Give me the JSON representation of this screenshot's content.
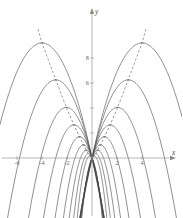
{
  "figure": {
    "title": "",
    "background_color": "#ffffff",
    "curve_color": "#4a4a4a",
    "axis_color": "#9a9a9a",
    "locus_color": "#7a7a7a",
    "label_color": "#6b6b6b"
  },
  "axes": {
    "x_axis_label": "x",
    "y_axis_label": "y",
    "origin_px": {
      "x": 92,
      "y": 158
    },
    "units_per_px": {
      "x": 12.5,
      "y": 12.5
    },
    "x_range": [
      -6.9,
      6.6
    ],
    "y_range": [
      -4.4,
      11.4
    ],
    "x_ticks": [
      {
        "value": -6,
        "label": "-6",
        "px": 17
      },
      {
        "value": -4,
        "label": "-4",
        "px": 42
      },
      {
        "value": -2,
        "label": "-2",
        "px": 67
      },
      {
        "value": 2,
        "label": "2",
        "px": 117
      },
      {
        "value": 4,
        "label": "4",
        "px": 142
      }
    ],
    "y_ticks": [
      {
        "value": 2,
        "label": "2",
        "px": 133
      },
      {
        "value": 4,
        "label": "4",
        "px": 108
      },
      {
        "value": 6,
        "label": "6",
        "px": 83
      },
      {
        "value": 8,
        "label": "8",
        "px": 58
      }
    ],
    "y_ticks_visible_labels": [
      "6",
      "8"
    ],
    "grid": false,
    "legend": false
  },
  "chart_data": {
    "type": "line",
    "title": "",
    "xlabel": "x",
    "ylabel": "y",
    "xlim": [
      -6.9,
      6.6
    ],
    "ylim": [
      -4.4,
      11.4
    ],
    "grid": false,
    "legend_position": "none",
    "series": [
      {
        "name": "parabola-left-1",
        "side": "left",
        "vertex": {
          "x": -4.0,
          "y": 9.2
        },
        "x_intercepts": [
          0.0,
          -8.0
        ],
        "style": "solid"
      },
      {
        "name": "parabola-left-2",
        "side": "left",
        "vertex": {
          "x": -2.9,
          "y": 6.25
        },
        "x_intercepts": [
          0.0,
          -5.8
        ],
        "style": "solid"
      },
      {
        "name": "parabola-left-3",
        "side": "left",
        "vertex": {
          "x": -2.05,
          "y": 4.05
        },
        "x_intercepts": [
          0.0,
          -4.1
        ],
        "style": "solid"
      },
      {
        "name": "parabola-left-4",
        "side": "left",
        "vertex": {
          "x": -1.45,
          "y": 2.65
        },
        "x_intercepts": [
          0.0,
          -2.9
        ],
        "style": "solid"
      },
      {
        "name": "parabola-left-5",
        "side": "left",
        "vertex": {
          "x": -1.0,
          "y": 1.7
        },
        "x_intercepts": [
          0.0,
          -2.0
        ],
        "style": "solid"
      },
      {
        "name": "parabola-left-6",
        "side": "left",
        "vertex": {
          "x": -0.68,
          "y": 1.05
        },
        "x_intercepts": [
          0.0,
          -1.36
        ],
        "style": "solid"
      },
      {
        "name": "parabola-left-7",
        "side": "left",
        "vertex": {
          "x": -0.46,
          "y": 0.62
        },
        "x_intercepts": [
          0.0,
          -0.92
        ],
        "style": "solid"
      },
      {
        "name": "parabola-left-8",
        "side": "left",
        "vertex": {
          "x": -0.3,
          "y": 0.34
        },
        "x_intercepts": [
          0.0,
          -0.6
        ],
        "style": "solid"
      },
      {
        "name": "parabola-left-9",
        "side": "left",
        "vertex": {
          "x": -0.18,
          "y": 0.16
        },
        "x_intercepts": [
          0.0,
          -0.36
        ],
        "style": "solid"
      },
      {
        "name": "parabola-right-1",
        "side": "right",
        "vertex": {
          "x": 4.0,
          "y": 9.2
        },
        "x_intercepts": [
          0.0,
          8.0
        ],
        "style": "solid"
      },
      {
        "name": "parabola-right-2",
        "side": "right",
        "vertex": {
          "x": 2.9,
          "y": 6.25
        },
        "x_intercepts": [
          0.0,
          5.8
        ],
        "style": "solid"
      },
      {
        "name": "parabola-right-3",
        "side": "right",
        "vertex": {
          "x": 2.05,
          "y": 4.05
        },
        "x_intercepts": [
          0.0,
          4.1
        ],
        "style": "solid"
      },
      {
        "name": "parabola-right-4",
        "side": "right",
        "vertex": {
          "x": 1.45,
          "y": 2.65
        },
        "x_intercepts": [
          0.0,
          2.9
        ],
        "style": "solid"
      },
      {
        "name": "parabola-right-5",
        "side": "right",
        "vertex": {
          "x": 1.0,
          "y": 1.7
        },
        "x_intercepts": [
          0.0,
          2.0
        ],
        "style": "solid"
      },
      {
        "name": "parabola-right-6",
        "side": "right",
        "vertex": {
          "x": 0.68,
          "y": 1.05
        },
        "x_intercepts": [
          0.0,
          1.36
        ],
        "style": "solid"
      },
      {
        "name": "parabola-right-7",
        "side": "right",
        "vertex": {
          "x": 0.46,
          "y": 0.62
        },
        "x_intercepts": [
          0.0,
          0.92
        ],
        "style": "solid"
      },
      {
        "name": "parabola-right-8",
        "side": "right",
        "vertex": {
          "x": 0.3,
          "y": 0.34
        },
        "x_intercepts": [
          0.0,
          0.6
        ],
        "style": "solid"
      },
      {
        "name": "parabola-right-9",
        "side": "right",
        "vertex": {
          "x": 0.18,
          "y": 0.16
        },
        "x_intercepts": [
          0.0,
          0.36
        ],
        "style": "solid"
      }
    ],
    "loci": [
      {
        "name": "vertex-locus-left",
        "style": "dashed",
        "points": [
          {
            "x": -0.1,
            "y": 0.06
          },
          {
            "x": -0.3,
            "y": 0.34
          },
          {
            "x": -0.68,
            "y": 1.05
          },
          {
            "x": -1.0,
            "y": 1.7
          },
          {
            "x": -1.45,
            "y": 2.65
          },
          {
            "x": -2.05,
            "y": 4.05
          },
          {
            "x": -2.9,
            "y": 6.25
          },
          {
            "x": -4.0,
            "y": 9.2
          },
          {
            "x": -4.35,
            "y": 10.4
          }
        ]
      },
      {
        "name": "vertex-locus-right",
        "style": "dashed",
        "points": [
          {
            "x": 0.1,
            "y": 0.06
          },
          {
            "x": 0.3,
            "y": 0.34
          },
          {
            "x": 0.68,
            "y": 1.05
          },
          {
            "x": 1.0,
            "y": 1.7
          },
          {
            "x": 1.45,
            "y": 2.65
          },
          {
            "x": 2.05,
            "y": 4.05
          },
          {
            "x": 2.9,
            "y": 6.25
          },
          {
            "x": 4.0,
            "y": 9.2
          },
          {
            "x": 4.35,
            "y": 10.4
          }
        ]
      }
    ]
  }
}
